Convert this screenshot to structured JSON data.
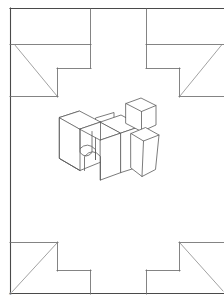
{
  "artwork": {
    "title": "Hi",
    "caption": "",
    "medium": "line drawing",
    "description": "Rectangular frame with four notched corners and a three-dimensional block lettering of the word Hi at the centre",
    "letter_text": "Hi",
    "corner_mark": "a"
  },
  "colors": {
    "background": "#ffffff",
    "frame_stroke": "#4a4a4a",
    "inner_stroke": "#6e6e6e",
    "diagonal_stroke": "#8a8a8a",
    "letter_stroke": "#5a5a5a",
    "letter_fill": "#ffffff",
    "mark": "#b8b8b8"
  },
  "frame": {
    "outer": {
      "left": 10,
      "top": 8,
      "right": 223,
      "bottom": 294
    },
    "corners": [
      {
        "name": "top-left",
        "label": "notched-corner-top-left"
      },
      {
        "name": "top-right",
        "label": "notched-corner-top-right"
      },
      {
        "name": "bottom-left",
        "label": "notched-corner-bottom-left"
      },
      {
        "name": "bottom-right",
        "label": "notched-corner-bottom-right"
      }
    ],
    "inner_verticals": [
      90,
      146
    ],
    "notch_horizontals": [
      44,
      250
    ]
  },
  "letter": {
    "glyph_h": "H",
    "glyph_i": "i",
    "style": "isometric extruded block",
    "center_x": 113,
    "center_y": 140
  }
}
